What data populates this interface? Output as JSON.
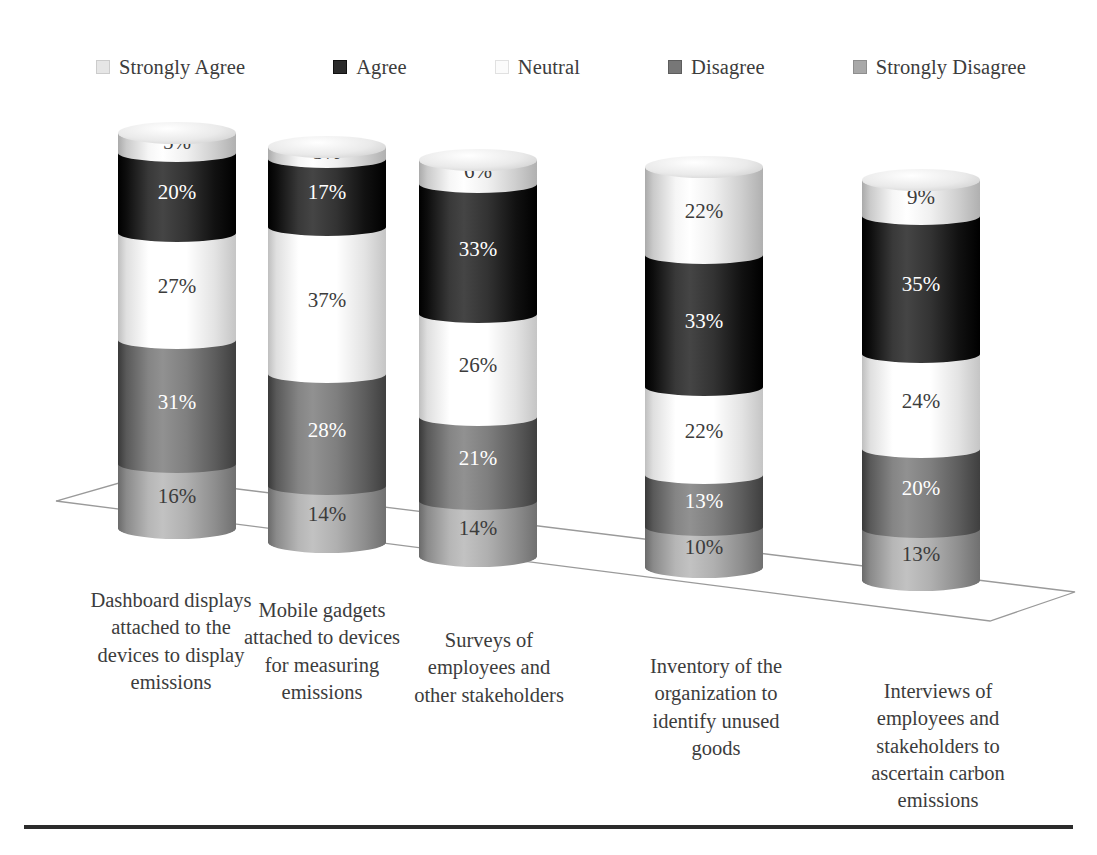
{
  "chart_data": {
    "type": "bar",
    "subtype": "stacked-3d-cylinder",
    "title": "",
    "xlabel": "",
    "ylabel": "",
    "grid": false,
    "legend_position": "top",
    "value_suffix": "%",
    "stack_order_top_to_bottom": [
      "Strongly Agree",
      "Agree",
      "Neutral",
      "Disagree",
      "Strongly Disagree"
    ],
    "categories": [
      "Dashboard displays attached to the devices to display emissions",
      "Mobile gadgets attached to devices for measuring emissions",
      "Surveys of employees and other stakeholders",
      "Inventory of the organization to identify unused goods",
      "Interviews of employees and stakeholders to ascertain carbon emissions"
    ],
    "series": [
      {
        "name": "Strongly Agree",
        "color": "#e8e8e8",
        "label_color": "#3c3c3c",
        "values": [
          5,
          3,
          6,
          22,
          9
        ]
      },
      {
        "name": "Agree",
        "color": "#2b2b2b",
        "label_color": "#ffffff",
        "values": [
          20,
          17,
          33,
          33,
          35
        ]
      },
      {
        "name": "Neutral",
        "color": "#fdfdfd",
        "label_color": "#3c3c3c",
        "values": [
          27,
          37,
          26,
          22,
          24
        ]
      },
      {
        "name": "Disagree",
        "color": "#777777",
        "label_color": "#ffffff",
        "values": [
          31,
          28,
          21,
          13,
          20
        ]
      },
      {
        "name": "Strongly Disagree",
        "color": "#a8a8a8",
        "label_color": "#3c3c3c",
        "values": [
          16,
          14,
          14,
          10,
          13
        ]
      }
    ]
  },
  "legend": {
    "items": [
      {
        "label": "Strongly Agree",
        "swatch": "#e6e6e6"
      },
      {
        "label": "Agree",
        "swatch": "#2b2b2b"
      },
      {
        "label": "Neutral",
        "swatch": "#fbfbfb"
      },
      {
        "label": "Disagree",
        "swatch": "#777777"
      },
      {
        "label": "Strongly Disagree",
        "swatch": "#a8a8a8"
      }
    ]
  },
  "bars": [
    {
      "category_lines": [
        "Dashboard displays",
        "attached to the",
        "devices to display",
        "emissions"
      ],
      "segments": [
        {
          "series": "Strongly Agree",
          "value": "5%"
        },
        {
          "series": "Agree",
          "value": "20%"
        },
        {
          "series": "Neutral",
          "value": "27%"
        },
        {
          "series": "Disagree",
          "value": "31%"
        },
        {
          "series": "Strongly Disagree",
          "value": "16%"
        }
      ]
    },
    {
      "category_lines": [
        "Mobile gadgets",
        "attached to devices",
        "for measuring",
        "emissions"
      ],
      "segments": [
        {
          "series": "Strongly Agree",
          "value": "3%"
        },
        {
          "series": "Agree",
          "value": "17%"
        },
        {
          "series": "Neutral",
          "value": "37%"
        },
        {
          "series": "Disagree",
          "value": "28%"
        },
        {
          "series": "Strongly Disagree",
          "value": "14%"
        }
      ]
    },
    {
      "category_lines": [
        "Surveys of",
        "employees and",
        "other stakeholders"
      ],
      "segments": [
        {
          "series": "Strongly Agree",
          "value": "6%"
        },
        {
          "series": "Agree",
          "value": "33%"
        },
        {
          "series": "Neutral",
          "value": "26%"
        },
        {
          "series": "Disagree",
          "value": "21%"
        },
        {
          "series": "Strongly Disagree",
          "value": "14%"
        }
      ]
    },
    {
      "category_lines": [
        "Inventory of the",
        "organization to",
        "identify unused",
        "goods"
      ],
      "segments": [
        {
          "series": "Strongly Agree",
          "value": "22%"
        },
        {
          "series": "Agree",
          "value": "33%"
        },
        {
          "series": "Neutral",
          "value": "22%"
        },
        {
          "series": "Disagree",
          "value": "13%"
        },
        {
          "series": "Strongly Disagree",
          "value": "10%"
        }
      ]
    },
    {
      "category_lines": [
        "Interviews of",
        "employees and",
        "stakeholders to",
        "ascertain carbon",
        "emissions"
      ],
      "segments": [
        {
          "series": "Strongly Agree",
          "value": "9%"
        },
        {
          "series": "Agree",
          "value": "35%"
        },
        {
          "series": "Neutral",
          "value": "24%"
        },
        {
          "series": "Disagree",
          "value": "20%"
        },
        {
          "series": "Strongly Disagree",
          "value": "13%"
        }
      ]
    }
  ],
  "layout": {
    "bar_x": [
      118,
      268,
      419,
      645,
      862
    ],
    "bar_top_y": [
      133,
      147,
      160,
      167,
      180
    ],
    "bar_height": [
      395,
      395,
      396,
      400,
      400
    ],
    "label_x": [
      52,
      208,
      378,
      607,
      820
    ],
    "label_y": [
      587,
      597,
      627,
      653,
      678
    ],
    "label_w": [
      238,
      228,
      222,
      218,
      236
    ]
  },
  "floor": {
    "stroke": "#9a9a9a",
    "stroke_width": 1.3,
    "points": "56,501 140,477 1075,592 990,621"
  },
  "bottom_rule_color": "#2b2b2b"
}
